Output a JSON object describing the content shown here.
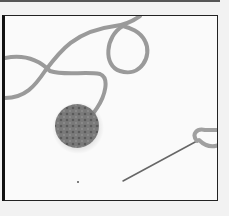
{
  "image": {
    "subject": "crochet yarn circle with tapestry needle",
    "elements": [
      "yarn-strand",
      "crochet-circle",
      "needle",
      "yarn-loop"
    ],
    "colors": {
      "background": "#fafafa",
      "yarn": "#9a9a9a",
      "crochet": "#707070",
      "needle": "#666666",
      "frame": "#222222"
    }
  }
}
